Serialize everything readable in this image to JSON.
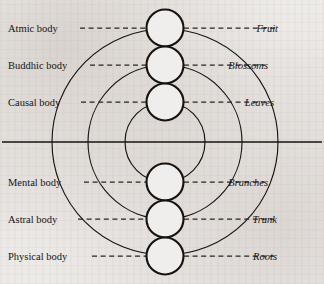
{
  "figure": {
    "background_color": "#edebe9",
    "ink_color": "#16120f",
    "center": {
      "x": 165,
      "y": 142
    },
    "ring_radii": [
      40,
      77,
      113
    ],
    "node_radius": 18.5,
    "nodes_cx": 165,
    "nodes_cy": [
      28,
      65,
      102,
      182,
      219,
      256
    ],
    "axis": {
      "x1": 2,
      "x2": 322,
      "y": 142
    }
  },
  "left_labels": [
    {
      "text": "Atmic body",
      "x": 8,
      "y": 32,
      "dash_x1": 80,
      "dash_x2": 146,
      "dash_y": 28
    },
    {
      "text": "Buddhic body",
      "x": 8,
      "y": 69,
      "dash_x1": 90,
      "dash_x2": 146,
      "dash_y": 65
    },
    {
      "text": "Causal body",
      "x": 8,
      "y": 106,
      "dash_x1": 81,
      "dash_x2": 146,
      "dash_y": 102
    },
    {
      "text": "Mental body",
      "x": 8,
      "y": 186,
      "dash_x1": 84,
      "dash_x2": 146,
      "dash_y": 182
    },
    {
      "text": "Astral body",
      "x": 8,
      "y": 223,
      "dash_x1": 78,
      "dash_x2": 146,
      "dash_y": 219
    },
    {
      "text": "Physical body",
      "x": 8,
      "y": 260,
      "dash_x1": 92,
      "dash_x2": 146,
      "dash_y": 256
    }
  ],
  "right_labels": [
    {
      "text": "Fruit",
      "x": 278,
      "y": 32,
      "dash_x1": 184,
      "dash_x2": 275,
      "dash_y": 28
    },
    {
      "text": "Blossoms",
      "x": 268,
      "y": 69,
      "dash_x1": 184,
      "dash_x2": 265,
      "dash_y": 65
    },
    {
      "text": "Leaves",
      "x": 274,
      "y": 106,
      "dash_x1": 184,
      "dash_x2": 271,
      "dash_y": 102
    },
    {
      "text": "Branches",
      "x": 268,
      "y": 186,
      "dash_x1": 184,
      "dash_x2": 265,
      "dash_y": 182
    },
    {
      "text": "Trunk",
      "x": 277,
      "y": 223,
      "dash_x1": 184,
      "dash_x2": 274,
      "dash_y": 219
    },
    {
      "text": "Roots",
      "x": 277,
      "y": 260,
      "dash_x1": 184,
      "dash_x2": 274,
      "dash_y": 256
    }
  ]
}
